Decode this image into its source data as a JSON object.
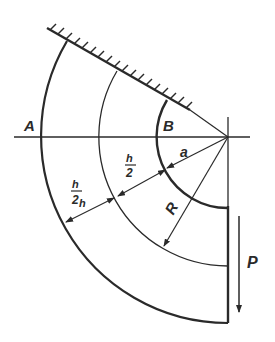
{
  "diagram": {
    "type": "curved beam (quarter ring) fixed to wall, loaded by force",
    "labels": {
      "point_a": "A",
      "point_b": "B",
      "inner_radius": "a",
      "centroid_radius": "R",
      "half_thickness_outer": "h/2",
      "half_thickness_inner": "h/2",
      "load": "P"
    },
    "fraction": {
      "num": "h",
      "den": "2"
    },
    "colors": {
      "stroke": "#2a2a2a",
      "background": "#ffffff"
    }
  }
}
